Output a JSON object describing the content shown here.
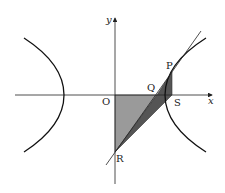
{
  "diagram": {
    "type": "hyperbola with tangent line and shaded triangles",
    "axes": {
      "x_label": "x",
      "y_label": "y",
      "origin_label": "O"
    },
    "points": {
      "P": "P",
      "Q": "Q",
      "R": "R",
      "S": "S",
      "O": "O"
    },
    "colors": {
      "curve": "#111111",
      "axis": "#222222",
      "light_shade": "#9a9a9a",
      "dark_shade": "#555555",
      "background": "#ffffff"
    }
  }
}
